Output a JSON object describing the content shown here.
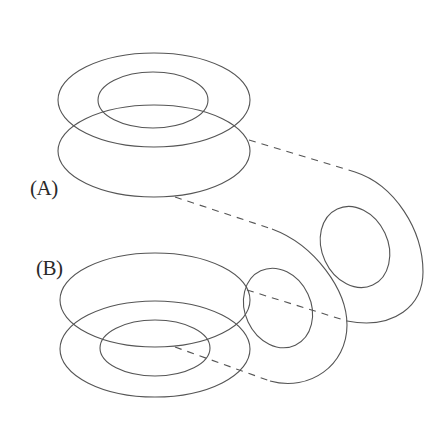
{
  "figure": {
    "type": "line-drawing diagram",
    "labels": {
      "a": "(A)",
      "b": "(B)"
    },
    "colors": {
      "stroke": "#555555",
      "label": "#2a2a2a",
      "background": "#ffffff"
    },
    "shapes": {
      "a_top_outer": {
        "cx": 154,
        "cy": 100,
        "rx": 96,
        "ry": 47
      },
      "a_top_inner": {
        "cx": 153,
        "cy": 100,
        "rx": 55,
        "ry": 28
      },
      "a_bottom_outer": {
        "cx": 154,
        "cy": 151,
        "rx": 96,
        "ry": 46
      },
      "b_top_outer": {
        "cx": 155,
        "cy": 300,
        "rx": 95,
        "ry": 47
      },
      "b_bottom_outer": {
        "cx": 155,
        "cy": 349,
        "rx": 95,
        "ry": 48
      },
      "b_inner": {
        "cx": 155,
        "cy": 348,
        "rx": 55,
        "ry": 28
      },
      "right_upper_inner": {
        "cx": 355,
        "cy": 247,
        "rx": 33,
        "ry": 42,
        "rotate": -25
      },
      "right_lower_inner": {
        "cx": 278,
        "cy": 308,
        "rx": 33,
        "ry": 41,
        "rotate": -25
      }
    }
  }
}
